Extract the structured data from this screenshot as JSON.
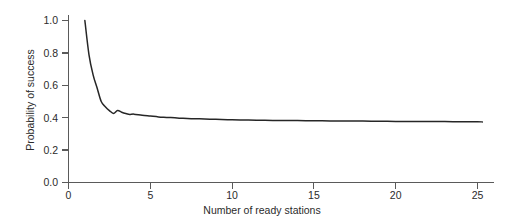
{
  "chart_data": {
    "type": "line",
    "title": "",
    "xlabel": "Number of ready stations",
    "ylabel": "Probability of success",
    "xlim": [
      0,
      25.8
    ],
    "ylim": [
      0.0,
      1.05
    ],
    "grid": false,
    "legend": null,
    "xticks": [
      0,
      5,
      10,
      15,
      20,
      25
    ],
    "xtick_labels": [
      "0",
      "5",
      "10",
      "15",
      "20",
      "25"
    ],
    "yticks": [
      0.0,
      0.2,
      0.4,
      0.6,
      0.8,
      1.0
    ],
    "ytick_labels": [
      "0.0",
      "0.2",
      "0.4",
      "0.6",
      "0.8",
      "1.0"
    ],
    "line_color": "#262626",
    "series": [
      {
        "name": "Probability of success",
        "x": [
          1,
          1.25,
          1.5,
          1.75,
          2,
          2.25,
          2.5,
          2.75,
          3,
          3.25,
          3.5,
          3.75,
          4,
          4.5,
          5,
          5.5,
          6,
          6.5,
          7,
          7.5,
          8,
          9,
          10,
          11,
          12,
          13,
          14,
          15,
          16,
          17,
          18,
          19,
          20,
          21,
          22,
          23,
          24,
          25,
          25.3
        ],
        "y": [
          1.0,
          0.79,
          0.666,
          0.583,
          0.5,
          0.468,
          0.444,
          0.426,
          0.444,
          0.434,
          0.426,
          0.42,
          0.422,
          0.415,
          0.41,
          0.405,
          0.402,
          0.399,
          0.396,
          0.394,
          0.393,
          0.39,
          0.387,
          0.386,
          0.384,
          0.383,
          0.382,
          0.381,
          0.38,
          0.379,
          0.379,
          0.378,
          0.377,
          0.377,
          0.376,
          0.376,
          0.375,
          0.375,
          0.374
        ]
      }
    ],
    "annotations": []
  },
  "axes": {
    "y_title": "Probability of success",
    "x_title": "Number of ready stations"
  }
}
